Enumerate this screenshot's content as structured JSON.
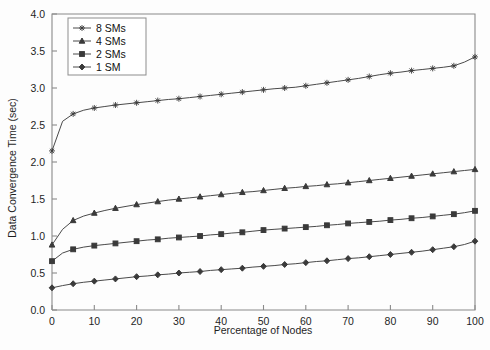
{
  "chart_data": {
    "type": "line",
    "title": "",
    "xlabel": "Percentage of Nodes",
    "ylabel": "Data Convergence Time (sec)",
    "xlim": [
      0,
      100
    ],
    "ylim": [
      0.0,
      4.0
    ],
    "xticks": [
      0,
      10,
      20,
      30,
      40,
      50,
      60,
      70,
      80,
      90,
      100
    ],
    "xtick_labels": [
      "0",
      "10",
      "20",
      "30",
      "40",
      "50",
      "60",
      "70",
      "80",
      "90",
      "100"
    ],
    "yticks": [
      0.0,
      0.5,
      1.0,
      1.5,
      2.0,
      2.5,
      3.0,
      3.5,
      4.0
    ],
    "ytick_labels": [
      "0.0",
      "0.5",
      "1.0",
      "1.5",
      "2.0",
      "2.5",
      "3.0",
      "3.5",
      "4.0"
    ],
    "grid": false,
    "legend_position": "upper-left",
    "line_color": "#4a4a4a",
    "x": [
      0,
      2.5,
      5,
      7.5,
      10,
      12.5,
      15,
      17.5,
      20,
      22.5,
      25,
      27.5,
      30,
      32.5,
      35,
      37.5,
      40,
      42.5,
      45,
      47.5,
      50,
      52.5,
      55,
      57.5,
      60,
      62.5,
      65,
      67.5,
      70,
      72.5,
      75,
      77.5,
      80,
      82.5,
      85,
      87.5,
      90,
      92.5,
      95,
      97.5,
      100
    ],
    "series": [
      {
        "name": "8 SMs",
        "marker": "star",
        "values": [
          2.15,
          2.55,
          2.65,
          2.7,
          2.73,
          2.75,
          2.77,
          2.785,
          2.8,
          2.815,
          2.83,
          2.845,
          2.855,
          2.87,
          2.885,
          2.9,
          2.915,
          2.93,
          2.945,
          2.96,
          2.975,
          2.99,
          3.0,
          3.01,
          3.03,
          3.05,
          3.07,
          3.09,
          3.11,
          3.13,
          3.155,
          3.18,
          3.2,
          3.215,
          3.235,
          3.25,
          3.265,
          3.28,
          3.3,
          3.35,
          3.42
        ]
      },
      {
        "name": "4 SMs",
        "marker": "triangle",
        "values": [
          0.88,
          1.09,
          1.21,
          1.27,
          1.31,
          1.345,
          1.375,
          1.4,
          1.425,
          1.445,
          1.465,
          1.485,
          1.5,
          1.515,
          1.53,
          1.545,
          1.56,
          1.575,
          1.59,
          1.6,
          1.615,
          1.63,
          1.645,
          1.655,
          1.67,
          1.68,
          1.695,
          1.705,
          1.72,
          1.735,
          1.75,
          1.765,
          1.78,
          1.795,
          1.81,
          1.825,
          1.84,
          1.855,
          1.87,
          1.885,
          1.9
        ]
      },
      {
        "name": "2 SMs",
        "marker": "square",
        "values": [
          0.66,
          0.77,
          0.82,
          0.85,
          0.87,
          0.885,
          0.9,
          0.915,
          0.93,
          0.945,
          0.955,
          0.97,
          0.98,
          0.99,
          1.0,
          1.015,
          1.025,
          1.04,
          1.05,
          1.065,
          1.08,
          1.09,
          1.1,
          1.11,
          1.12,
          1.13,
          1.145,
          1.155,
          1.17,
          1.18,
          1.19,
          1.2,
          1.215,
          1.225,
          1.24,
          1.25,
          1.265,
          1.28,
          1.295,
          1.315,
          1.34
        ]
      },
      {
        "name": "1 SM",
        "marker": "diamond",
        "values": [
          0.3,
          0.33,
          0.355,
          0.375,
          0.39,
          0.405,
          0.42,
          0.435,
          0.45,
          0.46,
          0.475,
          0.485,
          0.5,
          0.51,
          0.52,
          0.535,
          0.545,
          0.555,
          0.565,
          0.58,
          0.59,
          0.6,
          0.615,
          0.625,
          0.64,
          0.655,
          0.665,
          0.68,
          0.695,
          0.705,
          0.72,
          0.735,
          0.75,
          0.765,
          0.78,
          0.795,
          0.815,
          0.835,
          0.855,
          0.885,
          0.93
        ]
      }
    ]
  },
  "legend": {
    "entries": [
      {
        "label": "8 SMs"
      },
      {
        "label": "4 SMs"
      },
      {
        "label": "2 SMs"
      },
      {
        "label": "1 SM"
      }
    ]
  }
}
